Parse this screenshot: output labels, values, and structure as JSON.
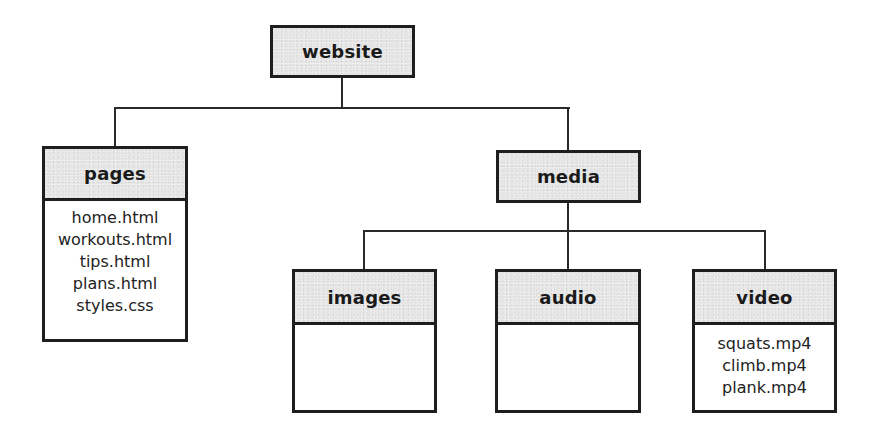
{
  "diagram": {
    "type": "folder-tree",
    "root": {
      "label": "website",
      "children": [
        "pages",
        "media"
      ]
    },
    "nodes": {
      "website": {
        "label": "website",
        "files": []
      },
      "pages": {
        "label": "pages",
        "files": [
          "home.html",
          "workouts.html",
          "tips.html",
          "plans.html",
          "styles.css"
        ]
      },
      "media": {
        "label": "media",
        "files": [],
        "children": [
          "images",
          "audio",
          "video"
        ]
      },
      "images": {
        "label": "images",
        "files": []
      },
      "audio": {
        "label": "audio",
        "files": []
      },
      "video": {
        "label": "video",
        "files": [
          "squats.mp4",
          "climb.mp4",
          "plank.mp4"
        ]
      }
    },
    "edges": [
      {
        "from": "website",
        "to": "pages"
      },
      {
        "from": "website",
        "to": "media"
      },
      {
        "from": "media",
        "to": "images"
      },
      {
        "from": "media",
        "to": "audio"
      },
      {
        "from": "media",
        "to": "video"
      }
    ],
    "colors": {
      "header_fill": "#e6e6e6",
      "body_fill": "#ffffff",
      "border": "#1e1e1e",
      "line": "#2a2a2a"
    }
  }
}
